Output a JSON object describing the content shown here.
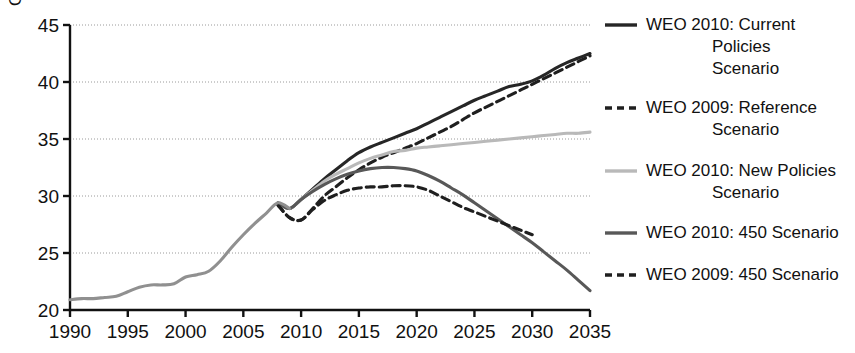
{
  "chart_data": {
    "type": "line",
    "title": "",
    "xlabel": "",
    "ylabel": "Gt",
    "xlim": [
      1990,
      2035
    ],
    "ylim": [
      20,
      45
    ],
    "grid": true,
    "gridlines_y": [
      25,
      30,
      35,
      40,
      45
    ],
    "legend_position": "right",
    "xticks": [
      "1990",
      "1995",
      "2000",
      "2005",
      "2010",
      "2015",
      "2020",
      "2025",
      "2030",
      "2035"
    ],
    "xtick_values": [
      1990,
      1995,
      2000,
      2005,
      2010,
      2015,
      2020,
      2025,
      2030,
      2035
    ],
    "yticks": [
      "20",
      "25",
      "30",
      "35",
      "40",
      "45"
    ],
    "ytick_values": [
      20,
      25,
      30,
      35,
      40,
      45
    ],
    "series": [
      {
        "name": "WEO 2010: Current Policies Scenario",
        "legend_label": "WEO 2010: Current\nPolicies\nScenario",
        "color": "#262626",
        "style": "solid",
        "width": 3.1,
        "x": [
          2008,
          2009,
          2010,
          2011,
          2012,
          2013,
          2014,
          2015,
          2016,
          2017,
          2018,
          2019,
          2020,
          2021,
          2022,
          2023,
          2024,
          2025,
          2026,
          2027,
          2028,
          2029,
          2030,
          2031,
          2032,
          2033,
          2034,
          2035
        ],
        "values": [
          29.4,
          28.9,
          29.7,
          30.6,
          31.5,
          32.3,
          33.1,
          33.8,
          34.3,
          34.7,
          35.1,
          35.5,
          35.9,
          36.4,
          36.9,
          37.4,
          37.9,
          38.4,
          38.8,
          39.2,
          39.6,
          39.8,
          40.1,
          40.6,
          41.2,
          41.7,
          42.1,
          42.5
        ]
      },
      {
        "name": "WEO 2009: Reference Scenario",
        "legend_label": "WEO 2009: Reference\nScenario",
        "color": "#1f1f1f",
        "style": "dashed",
        "width": 3.1,
        "x": [
          2008,
          2009,
          2010,
          2011,
          2012,
          2013,
          2014,
          2015,
          2016,
          2017,
          2018,
          2019,
          2020,
          2021,
          2022,
          2023,
          2024,
          2025,
          2026,
          2027,
          2028,
          2029,
          2030,
          2031,
          2032,
          2033,
          2034,
          2035
        ],
        "values": [
          29.2,
          28.1,
          27.9,
          28.9,
          30.0,
          30.8,
          31.6,
          32.3,
          32.9,
          33.4,
          33.8,
          34.2,
          34.6,
          35.1,
          35.6,
          36.1,
          36.7,
          37.3,
          37.8,
          38.3,
          38.8,
          39.3,
          39.8,
          40.3,
          40.8,
          41.3,
          41.8,
          42.3
        ]
      },
      {
        "name": "WEO 2010: New Policies Scenario",
        "legend_label": "WEO 2010: New Policies\nScenario",
        "color": "#b9b9b9",
        "style": "solid",
        "width": 3.1,
        "x": [
          2008,
          2009,
          2010,
          2011,
          2012,
          2013,
          2014,
          2015,
          2016,
          2017,
          2018,
          2019,
          2020,
          2021,
          2022,
          2023,
          2024,
          2025,
          2026,
          2027,
          2028,
          2029,
          2030,
          2031,
          2032,
          2033,
          2034,
          2035
        ],
        "values": [
          29.4,
          28.9,
          29.7,
          30.5,
          31.3,
          31.9,
          32.4,
          32.9,
          33.3,
          33.6,
          33.9,
          34.0,
          34.2,
          34.3,
          34.4,
          34.5,
          34.6,
          34.7,
          34.8,
          34.9,
          35.0,
          35.1,
          35.2,
          35.3,
          35.4,
          35.5,
          35.5,
          35.6
        ]
      },
      {
        "name": "WEO 2010: 450 Scenario",
        "legend_label": "WEO 2010: 450 Scenario",
        "color": "#585858",
        "style": "solid",
        "width": 3.1,
        "x": [
          2008,
          2009,
          2010,
          2011,
          2012,
          2013,
          2014,
          2015,
          2016,
          2017,
          2018,
          2019,
          2020,
          2021,
          2022,
          2023,
          2024,
          2025,
          2026,
          2027,
          2028,
          2029,
          2030,
          2031,
          2032,
          2033,
          2034,
          2035
        ],
        "values": [
          29.4,
          28.9,
          29.7,
          30.4,
          31.0,
          31.5,
          31.9,
          32.2,
          32.4,
          32.5,
          32.5,
          32.4,
          32.2,
          31.8,
          31.3,
          30.7,
          30.1,
          29.4,
          28.7,
          28.0,
          27.3,
          26.6,
          25.9,
          25.1,
          24.3,
          23.5,
          22.6,
          21.7
        ]
      },
      {
        "name": "WEO 2009: 450 Scenario",
        "legend_label": "WEO 2009: 450 Scenario",
        "color": "#1f1f1f",
        "style": "dashed",
        "width": 3.1,
        "x": [
          2008,
          2009,
          2010,
          2011,
          2012,
          2013,
          2014,
          2015,
          2016,
          2017,
          2018,
          2019,
          2020,
          2021,
          2022,
          2023,
          2024,
          2025,
          2026,
          2027,
          2028,
          2029,
          2030
        ],
        "values": [
          29.2,
          28.1,
          27.9,
          28.8,
          29.6,
          30.1,
          30.5,
          30.7,
          30.8,
          30.8,
          30.9,
          30.9,
          30.8,
          30.5,
          30.0,
          29.5,
          29.0,
          28.6,
          28.2,
          27.8,
          27.4,
          27.0,
          26.6
        ]
      },
      {
        "name": "Historical emissions",
        "legend_label": "",
        "color": "#909090",
        "style": "solid",
        "width": 3.1,
        "in_legend": false,
        "x": [
          1990,
          1991,
          1992,
          1993,
          1994,
          1995,
          1996,
          1997,
          1998,
          1999,
          2000,
          2001,
          2002,
          2003,
          2004,
          2005,
          2006,
          2007,
          2008,
          2009
        ],
        "values": [
          20.9,
          21.0,
          21.0,
          21.1,
          21.2,
          21.6,
          22.0,
          22.2,
          22.2,
          22.3,
          22.9,
          23.1,
          23.4,
          24.3,
          25.5,
          26.6,
          27.6,
          28.5,
          29.4,
          28.9
        ]
      }
    ]
  },
  "legend": {
    "entries": [
      {
        "label": "WEO 2010: Current\nPolicies\nScenario",
        "style": "solid",
        "color": "#262626"
      },
      {
        "label": "WEO 2009: Reference\nScenario",
        "style": "dashed",
        "color": "#1f1f1f"
      },
      {
        "label": "WEO 2010: New Policies\nScenario",
        "style": "solid",
        "color": "#b9b9b9"
      },
      {
        "label": "WEO 2010: 450 Scenario",
        "style": "solid",
        "color": "#585858"
      },
      {
        "label": "WEO 2009: 450 Scenario",
        "style": "dashed",
        "color": "#1f1f1f"
      }
    ]
  }
}
